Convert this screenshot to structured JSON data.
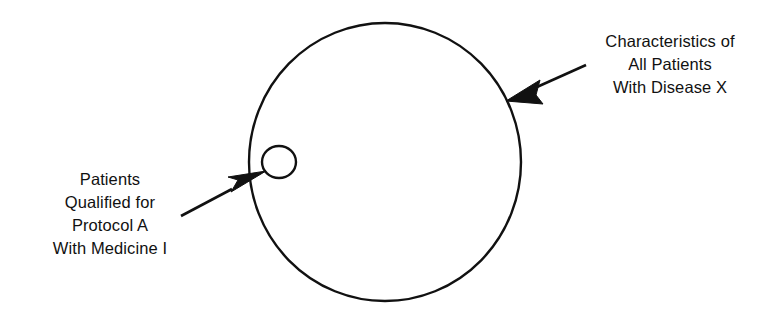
{
  "figure": {
    "type": "venn-style concept diagram",
    "background_color": "#ffffff",
    "stroke_color": "#111111",
    "shapes": {
      "outer_circle": {
        "name": "all-patients-circle",
        "cx": 385,
        "cy": 162,
        "rx": 136,
        "ry": 139,
        "stroke_width": 2.4,
        "fill": "none"
      },
      "inner_circle": {
        "name": "qualified-patients-circle",
        "cx": 279,
        "cy": 162,
        "rx": 17,
        "ry": 16,
        "stroke_width": 2.4,
        "fill": "none"
      }
    },
    "arrows": [
      {
        "name": "arrow-to-outer-circle",
        "from": [
          586,
          65
        ],
        "to": [
          506,
          101
        ],
        "points_at": "outer_circle_edge"
      },
      {
        "name": "arrow-to-inner-circle",
        "from": [
          181,
          216
        ],
        "to": [
          264,
          172
        ],
        "points_at": "inner_circle"
      }
    ]
  },
  "labels": {
    "outer": {
      "name": "characteristics-label",
      "lines": [
        "Characteristics of",
        "All Patients",
        "With Disease X"
      ]
    },
    "inner": {
      "name": "protocol-label",
      "lines": [
        "Patients",
        "Qualified for",
        "Protocol A",
        "With Medicine I"
      ]
    }
  }
}
